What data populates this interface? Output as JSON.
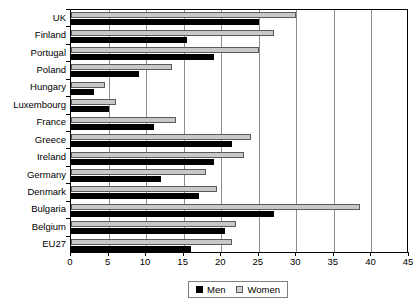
{
  "chart_data": {
    "type": "bar",
    "orientation": "horizontal",
    "title": "",
    "xlabel": "",
    "ylabel": "",
    "xlim": [
      0,
      45
    ],
    "xticks": [
      0,
      5,
      10,
      15,
      20,
      25,
      30,
      35,
      40,
      45
    ],
    "grid": true,
    "grid_axis": "x",
    "legend_position": "bottom-center",
    "categories": [
      "UK",
      "Finland",
      "Portugal",
      "Poland",
      "Hungary",
      "Luxembourg",
      "France",
      "Greece",
      "Ireland",
      "Germany",
      "Denmark",
      "Bulgaria",
      "Belgium",
      "EU27"
    ],
    "series": [
      {
        "name": "Men",
        "color": "#000000",
        "values": [
          25.0,
          15.5,
          19.0,
          9.0,
          3.0,
          5.0,
          11.0,
          21.5,
          19.0,
          12.0,
          17.0,
          27.0,
          20.5,
          16.0
        ]
      },
      {
        "name": "Women",
        "color": "#c8c8c8",
        "values": [
          30.0,
          27.0,
          25.0,
          13.5,
          4.5,
          6.0,
          14.0,
          24.0,
          23.0,
          18.0,
          19.5,
          38.5,
          22.0,
          21.5
        ]
      }
    ]
  },
  "legend": {
    "items": [
      {
        "label": "Men",
        "swatch": "men"
      },
      {
        "label": "Women",
        "swatch": "women"
      }
    ]
  }
}
